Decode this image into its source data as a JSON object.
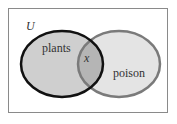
{
  "diagram": {
    "type": "venn",
    "universe_label": "U",
    "sets": [
      {
        "label": "plants",
        "fill": "#cfcfcf",
        "stroke": "#111111"
      },
      {
        "label": "poison",
        "fill": "#e4e4e4",
        "stroke": "#7a7a7a"
      }
    ],
    "intersection_label": "x",
    "intersection_fill": "#b5b5b5",
    "frame_stroke": "#8a8a8a"
  }
}
